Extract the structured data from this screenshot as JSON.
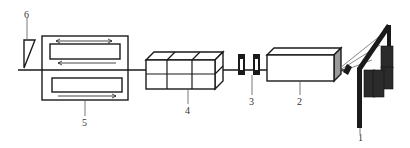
{
  "diagram": {
    "type": "process-line schematic",
    "colors": {
      "stroke": "#1a1a1a",
      "fill_dark": "#2b2b2b",
      "leader": "#555555",
      "background": "#ffffff"
    },
    "components": [
      {
        "id": "1",
        "label": "1",
        "name": "creel-with-bobbins"
      },
      {
        "id": "2",
        "label": "2",
        "name": "preforming-box"
      },
      {
        "id": "3",
        "label": "3",
        "name": "guide-plates"
      },
      {
        "id": "4",
        "label": "4",
        "name": "segmented-die"
      },
      {
        "id": "5",
        "label": "5",
        "name": "puller"
      },
      {
        "id": "6",
        "label": "6",
        "name": "cutter"
      }
    ]
  }
}
